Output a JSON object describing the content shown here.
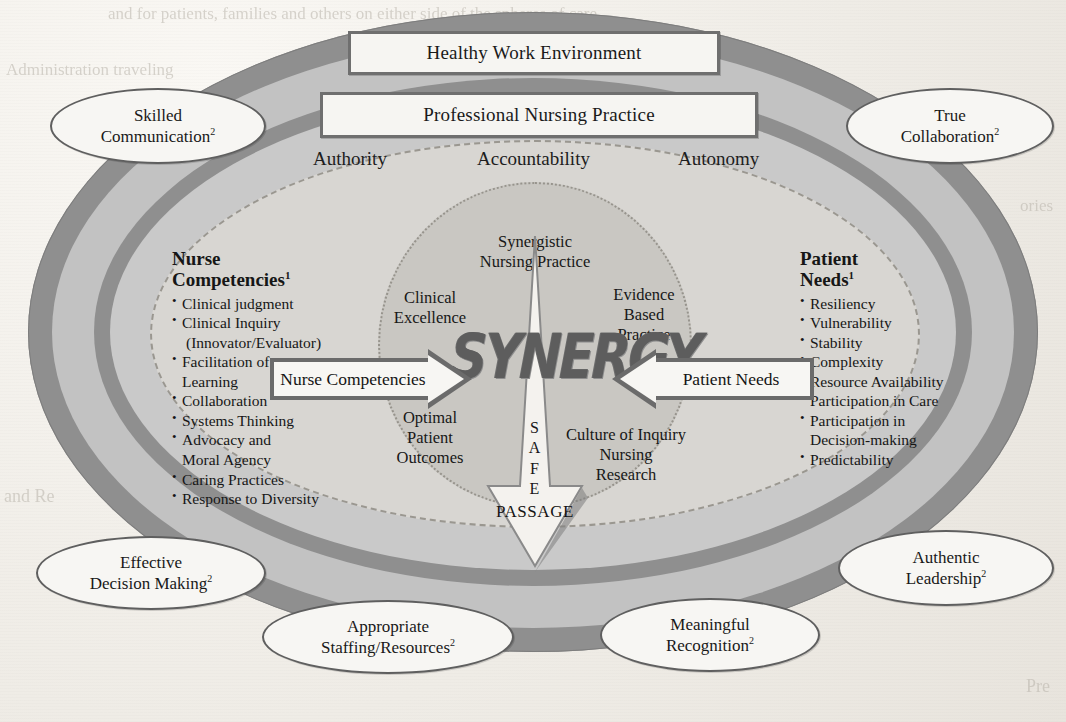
{
  "diagram": {
    "center_word": "SYNERGY",
    "top_boxes": [
      {
        "label": "Healthy Work Environment"
      },
      {
        "label": "Professional Nursing Practice"
      }
    ],
    "triad": [
      {
        "label": "Authority"
      },
      {
        "label": "Accountability"
      },
      {
        "label": "Autonomy"
      }
    ],
    "perimeter_ellipses": [
      {
        "line1": "Skilled",
        "line2": "Communication",
        "note": "2"
      },
      {
        "line1": "True",
        "line2": "Collaboration",
        "note": "2"
      },
      {
        "line1": "Effective",
        "line2": "Decision Making",
        "note": "2"
      },
      {
        "line1": "Authentic",
        "line2": "Leadership",
        "note": "2"
      },
      {
        "line1": "Appropriate",
        "line2": "Staffing/Resources",
        "note": "2"
      },
      {
        "line1": "Meaningful",
        "line2": "Recognition",
        "note": "2"
      }
    ],
    "left_block": {
      "heading_line1": "Nurse",
      "heading_line2": "Competencies",
      "heading_note": "1",
      "items": [
        "Clinical judgment",
        "Clinical Inquiry",
        "(Innovator/Evaluator)",
        "Facilitation of\nLearning",
        "Collaboration",
        "Systems Thinking",
        "Advocacy and\nMoral Agency",
        "Caring Practices",
        "Response to Diversity"
      ]
    },
    "right_block": {
      "heading_line1": "Patient",
      "heading_line2": "Needs",
      "heading_note": "1",
      "items": [
        "Resiliency",
        "Vulnerability",
        "Stability",
        "Complexity",
        "Resource Availability",
        "Participation in Care",
        "Participation in\nDecision-making",
        "Predictability"
      ]
    },
    "arrows": {
      "left_label": "Nurse Competencies",
      "right_label": "Patient Needs"
    },
    "lens_labels": {
      "top": "Synergistic\nNursing Practice",
      "upper_left": "Clinical\nExcellence",
      "upper_right": "Evidence\nBased\nPractice",
      "lower_left": "Optimal\nPatient\nOutcomes",
      "lower_right": "Culture of Inquiry\nNursing\nResearch"
    },
    "down_arrow": {
      "vertical_letters": "S\nA\nF\nE",
      "bottom_label": "PASSAGE"
    },
    "colors": {
      "paper": "#f2f0ec",
      "ring_dark": "#8f8f8f",
      "ring_light": "#c2c2c2",
      "field": "#c9c9c9",
      "core": "#d8d6d2",
      "outline": "#6b6b6b",
      "box_fill": "#f7f6f3",
      "ink": "#161616",
      "synergy": "#5d5d5d"
    }
  },
  "ghost_text": {
    "top": "and for patients, families and others on either side of the spheres of care",
    "left_upper": "Administration traveling",
    "right_upper": "ories",
    "left_lower": "and Re",
    "right_lower": "Pre"
  }
}
